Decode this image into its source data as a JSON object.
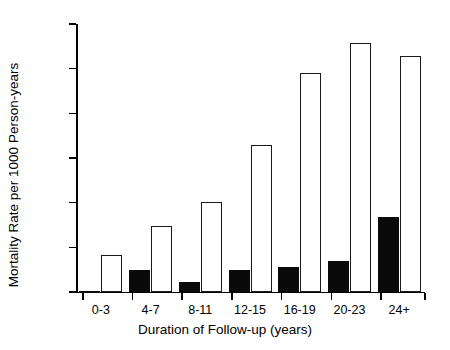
{
  "chart_data": {
    "type": "bar",
    "title": "",
    "xlabel": "Duration of Follow-up (years)",
    "ylabel": "Mortality Rate per 1000 Person-years",
    "categories": [
      "0-3",
      "4-7",
      "8-11",
      "12-15",
      "16-19",
      "20-23",
      "24+"
    ],
    "series": [
      {
        "name": "filled",
        "style": "solid-black",
        "values": [
          0.3,
          5.0,
          2.3,
          5.0,
          5.5,
          7.0,
          16.8
        ]
      },
      {
        "name": "open",
        "style": "white-outlined",
        "values": [
          8.2,
          14.8,
          20.2,
          32.8,
          49.0,
          55.8,
          52.8
        ]
      }
    ],
    "ylim": [
      0,
      60
    ],
    "yticks": [
      0,
      10,
      20,
      30,
      40,
      50,
      60
    ],
    "ytick_labels": [
      "0",
      "10",
      "20",
      "30",
      "40",
      "50",
      "60"
    ],
    "grid": false,
    "legend": "none"
  }
}
